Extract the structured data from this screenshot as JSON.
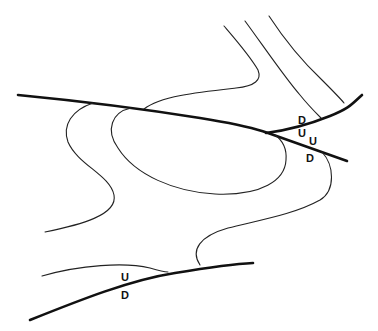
{
  "diagram": {
    "colors": {
      "line": "#111111",
      "background": "#ffffff"
    },
    "labels": [
      {
        "id": "upper-branch-d",
        "text": "D",
        "x": 298,
        "y": 124
      },
      {
        "id": "upper-branch-u",
        "text": "U",
        "x": 298,
        "y": 137
      },
      {
        "id": "lower-branch-u",
        "text": "U",
        "x": 309,
        "y": 145
      },
      {
        "id": "lower-branch-d",
        "text": "D",
        "x": 306,
        "y": 162
      },
      {
        "id": "bottom-fault-u",
        "text": "U",
        "x": 121,
        "y": 281
      },
      {
        "id": "bottom-fault-d",
        "text": "D",
        "x": 121,
        "y": 299
      }
    ]
  }
}
